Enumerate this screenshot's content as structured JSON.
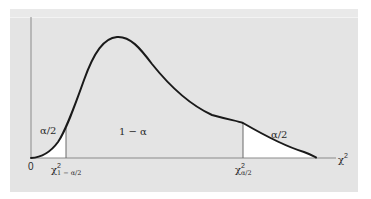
{
  "figure": {
    "title": "",
    "colors": {
      "panel_background": "#e4e4e4",
      "tail_fill": "#ffffff",
      "curve": "#1a1a1a",
      "axis": "#8a8a8a",
      "text": "#2a2a2a"
    },
    "labels": {
      "left_tail_area": "α/2",
      "center_area": "1 − α",
      "right_tail_area": "α/2",
      "origin": "0",
      "lower_critical_base": "χ",
      "lower_critical_sup": "2",
      "lower_critical_sub": "1 − α/2",
      "upper_critical_base": "χ",
      "upper_critical_sup": "2",
      "upper_critical_sub": "α/2",
      "x_axis_base": "χ",
      "x_axis_sup": "2"
    }
  }
}
